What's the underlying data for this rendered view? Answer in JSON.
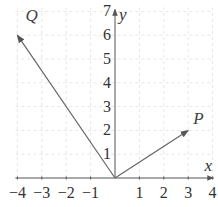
{
  "diagram": {
    "type": "vector-plot",
    "axes": {
      "x": {
        "label": "x",
        "min": -4,
        "max": 4,
        "ticks": [
          "−4",
          "−3",
          "−2",
          "−1",
          "1",
          "2",
          "3",
          "4"
        ],
        "tick_values": [
          -4,
          -3,
          -2,
          -1,
          1,
          2,
          3,
          4
        ]
      },
      "y": {
        "label": "y",
        "min": 0,
        "max": 7,
        "ticks": [
          "1",
          "2",
          "3",
          "4",
          "5",
          "6",
          "7"
        ],
        "tick_values": [
          1,
          2,
          3,
          4,
          5,
          6,
          7
        ]
      }
    },
    "grid": {
      "visible": true,
      "style": "dashed",
      "color": "#e6e6e6"
    },
    "vectors": [
      {
        "name": "P",
        "label": "P",
        "from": [
          0,
          0
        ],
        "to": [
          3,
          2
        ]
      },
      {
        "name": "Q",
        "label": "Q",
        "from": [
          0,
          0
        ],
        "to": [
          -4,
          6
        ]
      }
    ],
    "colors": {
      "axis": "#555555",
      "vector": "#666666",
      "text": "#333333"
    }
  }
}
